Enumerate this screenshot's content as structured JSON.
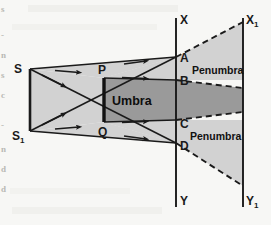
{
  "figure": {
    "background_color": "#f7f7f5",
    "colors": {
      "light_region": "#d2d2d2",
      "umbra_region": "#9a9a9a",
      "stroke": "#1a1a1a",
      "object_bar": "#111111",
      "label_text": "#111111",
      "margin_text": "#b9b9b4"
    }
  },
  "labels": {
    "source_top": "S",
    "source_bottom": "S",
    "source_bottom_sub": "1",
    "object_top": "P",
    "object_bottom": "Q",
    "screen1_top": "X",
    "screen1_bottom": "Y",
    "screen2_top": "X",
    "screen2_top_sub": "1",
    "screen2_bottom": "Y",
    "screen2_bottom_sub": "1",
    "point_a": "A",
    "point_b": "B",
    "point_c": "C",
    "point_d": "D",
    "umbra": "Umbra",
    "penumbra_upper": "Penumbra",
    "penumbra_lower": "Penumbra"
  },
  "margin_fragments": {
    "col": [
      "s",
      "-",
      "n",
      "s",
      "c",
      "-",
      "n",
      "d",
      "d"
    ]
  },
  "geometry": {
    "source_top_point": [
      30,
      69
    ],
    "source_bottom_point": [
      30,
      131
    ],
    "object_top_point": [
      104,
      78
    ],
    "object_bottom_point": [
      104,
      122
    ],
    "screen1_x": 176,
    "screen2_x": 243,
    "screen_top_y": 18,
    "screen_bottom_y": 207,
    "point_a_y": 57,
    "point_b_y": 80,
    "point_c_y": 120,
    "point_d_y": 143,
    "x1_y": 22,
    "y1_y": 186,
    "umbra_edge_upper_y": 88,
    "umbra_edge_lower_y": 112
  }
}
